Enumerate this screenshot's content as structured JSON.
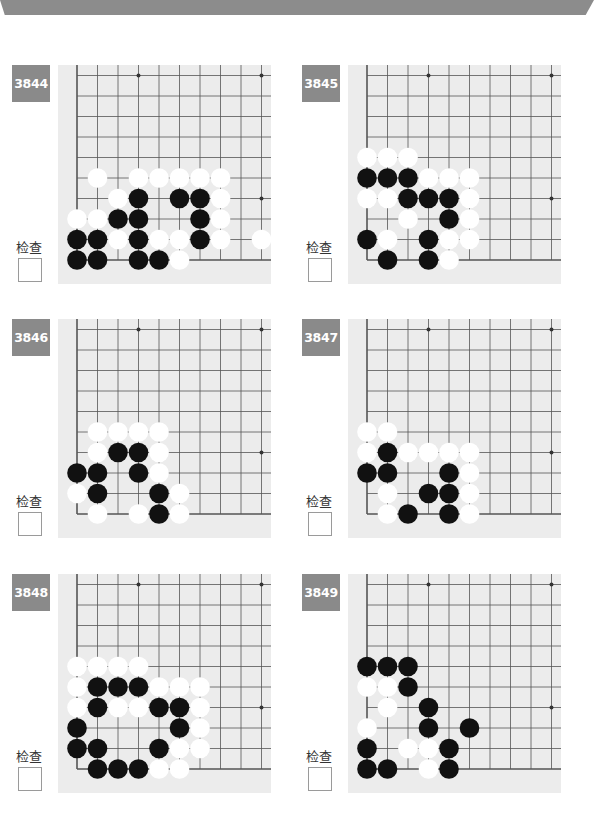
{
  "header": {
    "band_color": "#8c8c8c"
  },
  "check_label": "检查",
  "board_style": {
    "background": "#ececec",
    "line_color": "#555555",
    "black_stone": "#111111",
    "white_stone": "#ffffff"
  },
  "grid": {
    "cols": 10,
    "rows": 10,
    "origin_x": 19,
    "origin_y": 10.5,
    "spacing": 20.5
  },
  "star_points": [
    [
      3,
      0
    ],
    [
      9,
      0
    ],
    [
      9,
      6
    ],
    [
      3,
      6
    ]
  ],
  "problems": [
    {
      "number": "3844",
      "checked": false,
      "stones": {
        "white": [
          [
            1,
            5
          ],
          [
            3,
            5
          ],
          [
            4,
            5
          ],
          [
            5,
            5
          ],
          [
            6,
            5
          ],
          [
            7,
            5
          ],
          [
            2,
            6
          ],
          [
            7,
            6
          ],
          [
            0,
            7
          ],
          [
            1,
            7
          ],
          [
            7,
            7
          ],
          [
            2,
            8
          ],
          [
            4,
            8
          ],
          [
            5,
            8
          ],
          [
            7,
            8
          ],
          [
            9,
            8
          ],
          [
            5,
            9
          ]
        ],
        "black": [
          [
            3,
            6
          ],
          [
            5,
            6
          ],
          [
            6,
            6
          ],
          [
            2,
            7
          ],
          [
            3,
            7
          ],
          [
            6,
            7
          ],
          [
            0,
            8
          ],
          [
            1,
            8
          ],
          [
            3,
            8
          ],
          [
            6,
            8
          ],
          [
            0,
            9
          ],
          [
            1,
            9
          ],
          [
            3,
            9
          ],
          [
            4,
            9
          ]
        ]
      }
    },
    {
      "number": "3845",
      "checked": false,
      "stones": {
        "white": [
          [
            0,
            4
          ],
          [
            1,
            4
          ],
          [
            2,
            4
          ],
          [
            3,
            5
          ],
          [
            4,
            5
          ],
          [
            5,
            5
          ],
          [
            0,
            6
          ],
          [
            1,
            6
          ],
          [
            5,
            6
          ],
          [
            2,
            7
          ],
          [
            5,
            7
          ],
          [
            1,
            8
          ],
          [
            4,
            8
          ],
          [
            5,
            8
          ],
          [
            4,
            9
          ]
        ],
        "black": [
          [
            0,
            5
          ],
          [
            1,
            5
          ],
          [
            2,
            5
          ],
          [
            2,
            6
          ],
          [
            3,
            6
          ],
          [
            4,
            6
          ],
          [
            4,
            7
          ],
          [
            0,
            8
          ],
          [
            3,
            8
          ],
          [
            1,
            9
          ],
          [
            3,
            9
          ]
        ]
      }
    },
    {
      "number": "3846",
      "checked": false,
      "stones": {
        "white": [
          [
            1,
            5
          ],
          [
            2,
            5
          ],
          [
            3,
            5
          ],
          [
            4,
            5
          ],
          [
            1,
            6
          ],
          [
            4,
            6
          ],
          [
            4,
            7
          ],
          [
            0,
            8
          ],
          [
            5,
            8
          ],
          [
            1,
            9
          ],
          [
            3,
            9
          ],
          [
            5,
            9
          ]
        ],
        "black": [
          [
            2,
            6
          ],
          [
            3,
            6
          ],
          [
            0,
            7
          ],
          [
            1,
            7
          ],
          [
            3,
            7
          ],
          [
            1,
            8
          ],
          [
            4,
            8
          ],
          [
            4,
            9
          ]
        ]
      }
    },
    {
      "number": "3847",
      "checked": false,
      "stones": {
        "white": [
          [
            0,
            5
          ],
          [
            1,
            5
          ],
          [
            0,
            6
          ],
          [
            2,
            6
          ],
          [
            3,
            6
          ],
          [
            4,
            6
          ],
          [
            5,
            6
          ],
          [
            5,
            7
          ],
          [
            1,
            8
          ],
          [
            5,
            8
          ],
          [
            1,
            9
          ],
          [
            5,
            9
          ]
        ],
        "black": [
          [
            1,
            6
          ],
          [
            0,
            7
          ],
          [
            1,
            7
          ],
          [
            4,
            7
          ],
          [
            3,
            8
          ],
          [
            4,
            8
          ],
          [
            2,
            9
          ],
          [
            4,
            9
          ]
        ]
      }
    },
    {
      "number": "3848",
      "checked": false,
      "stones": {
        "white": [
          [
            0,
            4
          ],
          [
            1,
            4
          ],
          [
            2,
            4
          ],
          [
            3,
            4
          ],
          [
            0,
            5
          ],
          [
            4,
            5
          ],
          [
            5,
            5
          ],
          [
            6,
            5
          ],
          [
            0,
            6
          ],
          [
            2,
            6
          ],
          [
            3,
            6
          ],
          [
            6,
            6
          ],
          [
            6,
            7
          ],
          [
            5,
            8
          ],
          [
            6,
            8
          ],
          [
            4,
            9
          ],
          [
            5,
            9
          ]
        ],
        "black": [
          [
            1,
            5
          ],
          [
            2,
            5
          ],
          [
            3,
            5
          ],
          [
            1,
            6
          ],
          [
            4,
            6
          ],
          [
            5,
            6
          ],
          [
            0,
            7
          ],
          [
            5,
            7
          ],
          [
            0,
            8
          ],
          [
            1,
            8
          ],
          [
            4,
            8
          ],
          [
            1,
            9
          ],
          [
            2,
            9
          ],
          [
            3,
            9
          ]
        ]
      }
    },
    {
      "number": "3849",
      "checked": false,
      "stones": {
        "white": [
          [
            0,
            5
          ],
          [
            1,
            5
          ],
          [
            1,
            6
          ],
          [
            0,
            7
          ],
          [
            2,
            8
          ],
          [
            3,
            8
          ],
          [
            3,
            9
          ]
        ],
        "black": [
          [
            0,
            4
          ],
          [
            1,
            4
          ],
          [
            2,
            4
          ],
          [
            2,
            5
          ],
          [
            3,
            6
          ],
          [
            3,
            7
          ],
          [
            5,
            7
          ],
          [
            0,
            8
          ],
          [
            4,
            8
          ],
          [
            0,
            9
          ],
          [
            1,
            9
          ],
          [
            4,
            9
          ]
        ]
      }
    }
  ],
  "layout": {
    "positions": [
      {
        "left": 12,
        "top": 65,
        "board_left": 46
      },
      {
        "left": 302,
        "top": 65,
        "board_left": 46
      },
      {
        "left": 12,
        "top": 319,
        "board_left": 46
      },
      {
        "left": 302,
        "top": 319,
        "board_left": 46
      },
      {
        "left": 12,
        "top": 574,
        "board_left": 46
      },
      {
        "left": 302,
        "top": 574,
        "board_left": 46
      }
    ]
  }
}
